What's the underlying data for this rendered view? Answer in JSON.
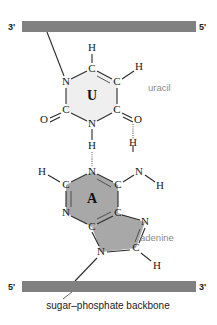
{
  "figure": {
    "colors": {
      "backbone_bar": "#808080",
      "uracil_ring_fill": "#efefef",
      "adenine_ring_fill": "#a8a8a8",
      "bond_stroke": "#2b2b2b",
      "hbond_stroke": "#6d6d6d",
      "name_label_color": "#8c8c8c",
      "background": "#ffffff"
    }
  },
  "top_strand": {
    "left_end_label": "3'",
    "right_end_label": "5'"
  },
  "bottom_strand": {
    "left_end_label": "5'",
    "right_end_label": "3'"
  },
  "caption": {
    "backbone_label": "sugar–phosphate backbone"
  },
  "uracil": {
    "name_label": "uracil",
    "center_letter": "U",
    "atoms": [
      {
        "id": "u-n1",
        "label": "N",
        "x": 66,
        "y": 82
      },
      {
        "id": "u-c6",
        "label": "C",
        "x": 92,
        "y": 69
      },
      {
        "id": "u-c5",
        "label": "C",
        "x": 117,
        "y": 82
      },
      {
        "id": "u-c4",
        "label": "C",
        "x": 117,
        "y": 110
      },
      {
        "id": "u-n3",
        "label": "N",
        "x": 92,
        "y": 124
      },
      {
        "id": "u-c2",
        "label": "C",
        "x": 66,
        "y": 110
      },
      {
        "id": "u-o2",
        "label": "O",
        "x": 44,
        "y": 119
      },
      {
        "id": "u-o4",
        "label": "O",
        "x": 137,
        "y": 119
      },
      {
        "id": "u-h6",
        "label": "H",
        "x": 92,
        "y": 48
      },
      {
        "id": "u-h5",
        "label": "H",
        "x": 140,
        "y": 69
      },
      {
        "id": "u-h3",
        "label": "H",
        "x": 92,
        "y": 146
      }
    ]
  },
  "adenine": {
    "name_label": "adenine",
    "center_letter": "A",
    "atoms": [
      {
        "id": "a-n1",
        "label": "N",
        "x": 92,
        "y": 172
      },
      {
        "id": "a-c6",
        "label": "C",
        "x": 118,
        "y": 185
      },
      {
        "id": "a-c5",
        "label": "C",
        "x": 118,
        "y": 213
      },
      {
        "id": "a-c4",
        "label": "C",
        "x": 92,
        "y": 227
      },
      {
        "id": "a-n3",
        "label": "N",
        "x": 66,
        "y": 213
      },
      {
        "id": "a-c2",
        "label": "C",
        "x": 66,
        "y": 185
      },
      {
        "id": "a-h2",
        "label": "H",
        "x": 42,
        "y": 172
      },
      {
        "id": "a-n6",
        "label": "N",
        "x": 140,
        "y": 172
      },
      {
        "id": "a-h61",
        "label": "H",
        "x": 140,
        "y": 150
      },
      {
        "id": "a-h62",
        "label": "H",
        "x": 160,
        "y": 185
      },
      {
        "id": "a-n7",
        "label": "N",
        "x": 145,
        "y": 222
      },
      {
        "id": "a-c8",
        "label": "C",
        "x": 136,
        "y": 248
      },
      {
        "id": "a-n9",
        "label": "N",
        "x": 101,
        "y": 252
      },
      {
        "id": "a-h8",
        "label": "H",
        "x": 157,
        "y": 265
      }
    ]
  },
  "hydrogen_bonds": [
    {
      "id": "hbond-left",
      "from": "uracil-N3-H",
      "to": "adenine-N1",
      "x": 92,
      "y1": 152,
      "y2": 167
    },
    {
      "id": "hbond-right",
      "from": "uracil-O4",
      "to": "adenine-N6-H",
      "x": 133,
      "y1": 122,
      "y2": 139
    }
  ]
}
